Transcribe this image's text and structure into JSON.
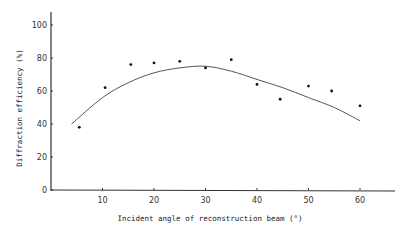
{
  "chart_data": {
    "type": "scatter",
    "title": "",
    "xlabel": "Incident angle of reconstruction beam (°)",
    "ylabel": "Diffraction efficiency (%)",
    "xlim": [
      0,
      65
    ],
    "ylim": [
      0,
      100
    ],
    "x_ticks": [
      10,
      20,
      30,
      40,
      50,
      60
    ],
    "y_ticks": [
      0,
      20,
      40,
      60,
      80,
      100
    ],
    "grid": false,
    "legend": null,
    "series": [
      {
        "name": "measured",
        "type": "scatter",
        "points": [
          {
            "x": 5.5,
            "y": 38
          },
          {
            "x": 10.5,
            "y": 62
          },
          {
            "x": 15.5,
            "y": 76
          },
          {
            "x": 20,
            "y": 77
          },
          {
            "x": 25,
            "y": 78
          },
          {
            "x": 30,
            "y": 74
          },
          {
            "x": 35,
            "y": 79
          },
          {
            "x": 40,
            "y": 64
          },
          {
            "x": 44.5,
            "y": 55
          },
          {
            "x": 50,
            "y": 63
          },
          {
            "x": 54.5,
            "y": 60
          },
          {
            "x": 60,
            "y": 51
          }
        ]
      },
      {
        "name": "fit curve",
        "type": "line",
        "points": [
          {
            "x": 4,
            "y": 40
          },
          {
            "x": 10,
            "y": 56
          },
          {
            "x": 15,
            "y": 65
          },
          {
            "x": 20,
            "y": 71
          },
          {
            "x": 25,
            "y": 74
          },
          {
            "x": 30,
            "y": 75
          },
          {
            "x": 35,
            "y": 72
          },
          {
            "x": 40,
            "y": 67
          },
          {
            "x": 45,
            "y": 62
          },
          {
            "x": 50,
            "y": 56
          },
          {
            "x": 55,
            "y": 50
          },
          {
            "x": 60,
            "y": 42
          }
        ]
      }
    ]
  },
  "labels": {
    "xlabel": "Incident angle of reconstruction beam (°)",
    "ylabel": "Diffraction efficiency (%)"
  }
}
